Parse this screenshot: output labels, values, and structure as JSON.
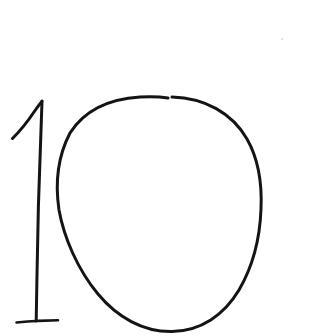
{
  "canvas": {
    "width": 331,
    "height": 336,
    "background_color": "#ffffff",
    "ink_color": "#141414",
    "medium": "pencil-on-paper",
    "transcription": "10",
    "alt_text": "Hand-drawn number 10 in dark pencil on white paper"
  },
  "strokes": [
    {
      "name": "digit-one-flag",
      "glyph": "1",
      "part": "upper-left diagonal flag",
      "color": "#141414",
      "width": 3.0,
      "start": [
        12,
        138
      ],
      "end": [
        42,
        101
      ],
      "path": "M 12.5 138.5 C 20 131 28 121 34 112 C 37.5 107 40 103.5 42 101.2"
    },
    {
      "name": "digit-one-stem",
      "glyph": "1",
      "part": "vertical stem",
      "color": "#141414",
      "width": 3.0,
      "start": [
        42,
        101
      ],
      "end": [
        36,
        321
      ],
      "path": "M 42 101.2 C 41 130 39.5 168 38.4 206 C 37.6 242 36.8 283 36.2 321"
    },
    {
      "name": "digit-one-base-serif",
      "glyph": "1",
      "part": "horizontal base serif",
      "color": "#141414",
      "width": 2.6,
      "start": [
        16,
        322
      ],
      "end": [
        58,
        320
      ],
      "path": "M 16.5 322.5 C 26 321.6 32 321.2 36.2 321 C 44 320.7 52 320.4 58 320.2"
    },
    {
      "name": "digit-zero-oval",
      "glyph": "0",
      "part": "closed oval loop",
      "color": "#141414",
      "width": 3.0,
      "start": [
        172,
        97
      ],
      "end": [
        168,
        98
      ],
      "path": "M 172 97 C 205 98 232 113 247 139 C 259 160 262 186 261 209 C 260 237 253 266 239 290 C 224 315 201 331 172 331.5 C 143 332 117 317 98 294 C 78 270 64 238 59 210 C 55 183 58 156 70 133 C 84 111 108 99 140 97 C 150 96.5 160 96.7 168 98"
    }
  ],
  "specks": [
    {
      "name": "paper-speck-upper-right",
      "x": 281,
      "y": 38,
      "size": 2,
      "color": "#d9d9d9"
    }
  ],
  "chart_data": {
    "type": "table",
    "categories": [
      "glyph-1",
      "glyph-0"
    ],
    "values": [
      1,
      0
    ],
    "annotations": [
      "10"
    ]
  }
}
